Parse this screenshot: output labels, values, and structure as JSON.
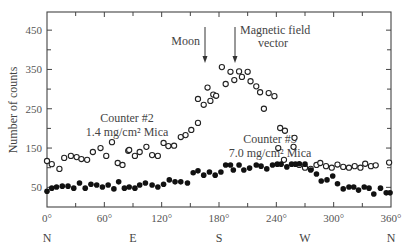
{
  "chart_data": {
    "type": "scatter",
    "title": "",
    "xlabel": "",
    "ylabel": "Number of counts",
    "xlim": [
      0,
      360
    ],
    "ylim": [
      0,
      480
    ],
    "grid": false,
    "legend": "none (inline annotations)",
    "x_ticks": [
      {
        "value": 0,
        "label": "0°"
      },
      {
        "value": 60,
        "label": "60°"
      },
      {
        "value": 120,
        "label": "120°"
      },
      {
        "value": 180,
        "label": "180°"
      },
      {
        "value": 240,
        "label": "240°"
      },
      {
        "value": 300,
        "label": "300°"
      },
      {
        "value": 360,
        "label": "360°"
      }
    ],
    "direction_labels": [
      {
        "value": 0,
        "label": "N"
      },
      {
        "value": 90,
        "label": "E"
      },
      {
        "value": 180,
        "label": "S"
      },
      {
        "value": 270,
        "label": "W"
      },
      {
        "value": 360,
        "label": "N"
      }
    ],
    "y_ticks": [
      {
        "value": 50,
        "label": "50"
      },
      {
        "value": 150,
        "label": "150"
      },
      {
        "value": 250,
        "label": "250"
      },
      {
        "value": 350,
        "label": "350"
      },
      {
        "value": 450,
        "label": "450"
      }
    ],
    "annotations": [
      {
        "text": "Moon",
        "x": 166,
        "type": "arrow"
      },
      {
        "text": "Magnetic field vector",
        "lines": [
          "Magnetic field",
          "vector"
        ],
        "x": 197,
        "type": "arrow"
      },
      {
        "text": "Counter #2 1.4 mg/cm² Mica",
        "lines": [
          "Counter #2",
          "1.4 mg/cm² Mica"
        ]
      },
      {
        "text": "Counter #3 7.0 mg/cm² Mica",
        "lines": [
          "Counter #3",
          "7.0 mg/cm² Mica"
        ]
      }
    ],
    "series": [
      {
        "name": "Counter #2 (1.4 mg/cm² Mica)",
        "marker": "open-circle",
        "x": [
          0,
          5,
          13,
          18,
          25,
          31,
          36,
          42,
          48,
          56,
          62,
          68,
          74,
          79,
          85,
          86,
          92,
          97,
          104,
          110,
          116,
          122,
          127,
          133,
          140,
          145,
          151,
          158,
          158,
          164,
          168,
          171,
          174,
          177,
          183,
          187,
          192,
          196,
          201,
          204,
          210,
          213,
          219,
          223,
          227,
          232,
          238,
          242,
          244,
          248,
          249,
          258,
          259,
          264,
          270,
          276,
          282,
          286,
          292,
          298,
          304,
          310,
          316,
          322,
          328,
          333,
          339,
          344,
          358
        ],
        "y": [
          117,
          109,
          97,
          125,
          130,
          127,
          122,
          120,
          140,
          150,
          130,
          165,
          112,
          107,
          143,
          145,
          130,
          140,
          153,
          132,
          130,
          163,
          155,
          156,
          178,
          183,
          196,
          214,
          275,
          260,
          304,
          270,
          286,
          283,
          356,
          313,
          344,
          323,
          345,
          331,
          344,
          320,
          307,
          292,
          250,
          290,
          282,
          150,
          201,
          120,
          194,
          153,
          176,
          107,
          100,
          97,
          107,
          112,
          104,
          100,
          108,
          102,
          100,
          104,
          100,
          110,
          104,
          106,
          113
        ]
      },
      {
        "name": "Counter #3 (7.0 mg/cm² Mica)",
        "marker": "filled-circle",
        "x": [
          0,
          5,
          10,
          16,
          22,
          28,
          34,
          40,
          46,
          52,
          58,
          64,
          70,
          75,
          81,
          86,
          92,
          97,
          103,
          110,
          116,
          122,
          128,
          134,
          140,
          147,
          153,
          158,
          164,
          170,
          176,
          182,
          187,
          192,
          195,
          201,
          206,
          212,
          219,
          224,
          230,
          236,
          241,
          245,
          251,
          256,
          260,
          264,
          270,
          276,
          282,
          287,
          293,
          299,
          304,
          310,
          316,
          321,
          326,
          332,
          337,
          342,
          349,
          355,
          359
        ],
        "y": [
          40,
          48,
          51,
          53,
          53,
          48,
          61,
          48,
          58,
          56,
          51,
          56,
          46,
          64,
          48,
          51,
          48,
          56,
          61,
          56,
          51,
          58,
          69,
          64,
          64,
          61,
          87,
          92,
          81,
          89,
          81,
          89,
          107,
          107,
          94,
          107,
          94,
          99,
          107,
          104,
          97,
          107,
          109,
          109,
          102,
          109,
          109,
          110,
          109,
          94,
          84,
          66,
          69,
          79,
          59,
          46,
          51,
          51,
          43,
          51,
          48,
          33,
          48,
          36,
          36
        ]
      }
    ]
  }
}
